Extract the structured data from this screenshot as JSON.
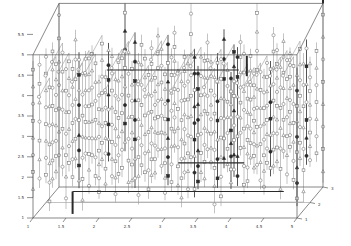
{
  "chart_data": {
    "type": "scatter",
    "title": "",
    "subtitle": "",
    "xlabel": "",
    "ylabel": "",
    "zlabel": "",
    "x_ticks": [
      "1",
      "1.5",
      "2",
      "2.5",
      "3",
      "3.5",
      "4",
      "4.5",
      "5"
    ],
    "x_values": [
      1,
      1.5,
      2,
      2.5,
      3,
      3.5,
      4,
      4.5,
      5
    ],
    "y_ticks": [
      "1",
      "1.5",
      "2",
      "2.5",
      "3",
      "3.5",
      "4",
      "4.5",
      "5",
      "5.5"
    ],
    "y_values": [
      1,
      1.5,
      2,
      2.5,
      3,
      3.5,
      4,
      4.5,
      5,
      5.5
    ],
    "z_ticks": [
      "1",
      "2",
      "3"
    ],
    "z_values": [
      1,
      2,
      3
    ],
    "xlim": [
      1,
      5
    ],
    "ylim": [
      1,
      5.5
    ],
    "zlim": [
      1,
      3
    ],
    "grid": false,
    "legend": null,
    "markers": [
      "circle",
      "triangle",
      "square"
    ],
    "colors": {
      "stem": "#9a9a9a",
      "marker_stroke": "#7a7a7a",
      "highlight": "#2a2a2a",
      "frame": "#555555",
      "axis": "#444444"
    },
    "highlighted_segments": [
      {
        "name": "upper-dark-edge",
        "from": [
          2,
          4.4,
          1.6
        ],
        "to": [
          4,
          4.4,
          1.6
        ]
      },
      {
        "name": "lower-dark-edge",
        "from": [
          1.6,
          1.65,
          1
        ],
        "to": [
          4.8,
          1.65,
          1
        ]
      },
      {
        "name": "inner-dark-edge",
        "from": [
          3.2,
          2.35,
          1
        ],
        "to": [
          4.2,
          2.35,
          1
        ]
      },
      {
        "name": "left-dark-post",
        "from": [
          1.6,
          1.1,
          1
        ],
        "to": [
          1.6,
          1.65,
          1
        ]
      },
      {
        "name": "right-dark-post",
        "from": [
          4.2,
          4.9,
          1.2
        ],
        "to": [
          4.2,
          4.4,
          1.2
        ]
      },
      {
        "name": "top-right-stick",
        "from": [
          5,
          6.3,
          3
        ],
        "to": [
          5,
          5.5,
          3
        ]
      }
    ]
  }
}
